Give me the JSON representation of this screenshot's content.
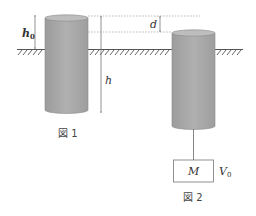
{
  "figure1": {
    "caption": "図 1",
    "labels": {
      "h0_main": "h",
      "h0_sub": "0",
      "h": "h"
    }
  },
  "figure2": {
    "caption": "図 2",
    "labels": {
      "d": "d",
      "mass": "M",
      "volume_main": "V",
      "volume_sub": "0"
    }
  },
  "colors": {
    "cylinder_fill": "#a9a9a9",
    "cylinder_top": "#b8b8b8",
    "line": "#555555",
    "dotted": "#888888"
  }
}
